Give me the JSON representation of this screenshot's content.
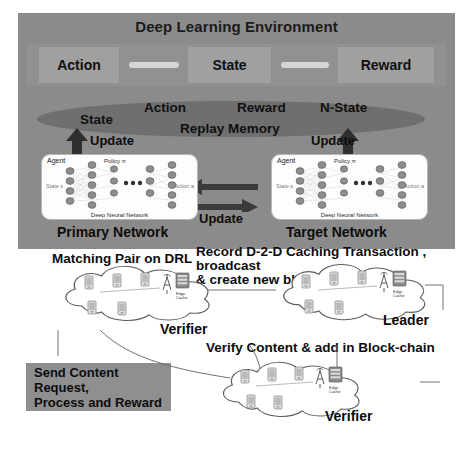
{
  "diagram": {
    "title": "Deep Learning Environment",
    "environment": {
      "panel_color": "#8b8b8b",
      "boxes": [
        {
          "label": "Action"
        },
        {
          "label": "State"
        },
        {
          "label": "Reward"
        }
      ]
    },
    "replay_memory": {
      "ellipse_color": "#6f6f6f",
      "name": "Replay Memory",
      "fields": [
        "State",
        "Action",
        "Reward",
        "N-State"
      ]
    },
    "update_labels": {
      "left": "Update",
      "right": "Update",
      "middle": "Update"
    },
    "networks": [
      {
        "caption": "Primary Network",
        "agent": "Agent",
        "policy": "Policy π",
        "input": "State s",
        "output": "Action a",
        "footer": "Deep Neural Network"
      },
      {
        "caption": "Target Network",
        "agent": "Agent",
        "policy": "Policy π",
        "input": "State s",
        "output": "Action a",
        "footer": "Deep Neural Network"
      }
    ],
    "blockchain": {
      "matching_text": "Matching Pair on DRL",
      "record_text": "Record D-2-D Caching Transaction , broadcast\n& create new block",
      "verify_text": "Verify Content & add in Block-chain",
      "request_box": "Send Content Request,\nProcess and Reward",
      "clouds": [
        {
          "label": "Verifier",
          "node_label": "Edge Cache"
        },
        {
          "label": "Leader",
          "node_label": "Edge Cache"
        },
        {
          "label": "Verifier",
          "node_label": "Edge Cache"
        }
      ]
    }
  }
}
